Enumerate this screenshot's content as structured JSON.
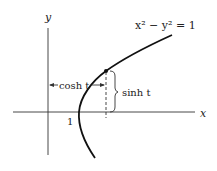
{
  "diagram": {
    "equation": "x² − y² = 1",
    "axis_x_label": "x",
    "axis_y_label": "y",
    "tick_one": "1",
    "cosh_label": "cosh t",
    "sinh_label": "sinh t",
    "colors": {
      "ink": "#222222",
      "background": "#ffffff"
    }
  }
}
